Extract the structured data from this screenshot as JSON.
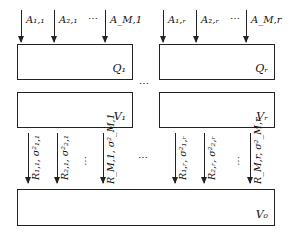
{
  "inputs_left": {
    "labels": [
      "A1,1",
      "A2,1",
      "AM,1"
    ],
    "display": [
      "A₁,₁",
      "A₂,₁",
      "A_M,1"
    ],
    "ellipsis": "⋯"
  },
  "inputs_right": {
    "labels": [
      "A1,r",
      "A2,r",
      "AM,r"
    ],
    "display": [
      "A₁,ᵣ",
      "A₂,ᵣ",
      "A_M,r"
    ],
    "ellipsis": "⋯"
  },
  "boxes": {
    "q1": "Q₁",
    "qr": "Qᵣ",
    "v1": "V₁",
    "vr": "Vᵣ",
    "v0": "V₀"
  },
  "middle_ellipsis": "⋯",
  "outputs_left": {
    "display": [
      "R₁,₁, σ²₁,₁",
      "R₂,₁, σ²₂,₁",
      "R_M,1, σ²_M,1"
    ],
    "ellipsis": "⋯"
  },
  "outputs_right": {
    "display": [
      "R₁,ᵣ, σ²₁,ᵣ",
      "R₂,ᵣ, σ²₂,ᵣ",
      "R_M,r, σ²_M,r"
    ],
    "ellipsis": "⋯"
  },
  "outputs_middle_ellipsis": "⋯"
}
